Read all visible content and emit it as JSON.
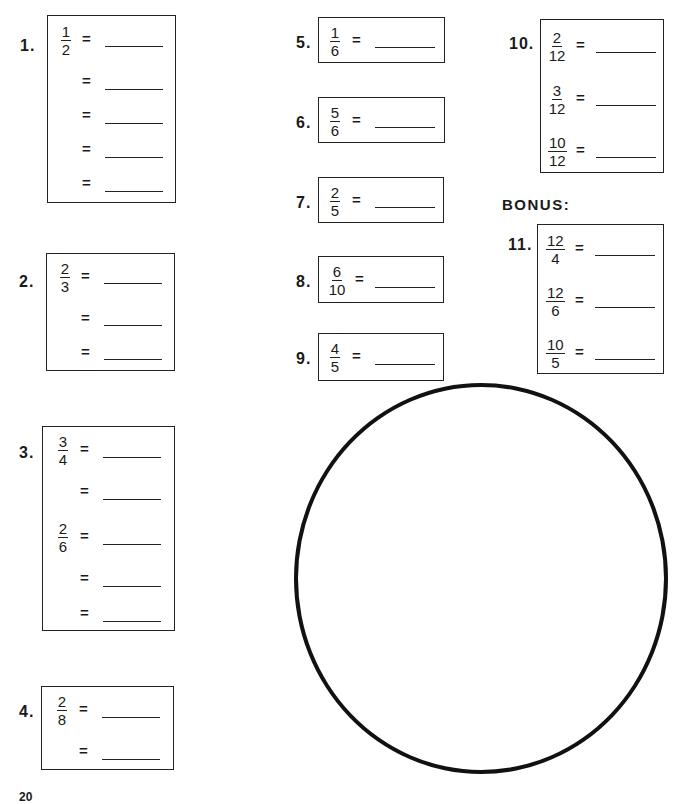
{
  "worksheet": {
    "bonus_label": "BONUS:",
    "equals_sign": "=",
    "page_number": "20",
    "problems": [
      {
        "label": "1.",
        "fractions": [
          {
            "n": "1",
            "d": "2"
          }
        ],
        "blank_count": 5
      },
      {
        "label": "2.",
        "fractions": [
          {
            "n": "2",
            "d": "3"
          }
        ],
        "blank_count": 3
      },
      {
        "label": "3.",
        "fractions": [
          {
            "n": "3",
            "d": "4"
          },
          {
            "n": "2",
            "d": "6"
          }
        ],
        "blank_count": 5
      },
      {
        "label": "4.",
        "fractions": [
          {
            "n": "2",
            "d": "8"
          }
        ],
        "blank_count": 2
      },
      {
        "label": "5.",
        "fractions": [
          {
            "n": "1",
            "d": "6"
          }
        ],
        "blank_count": 1
      },
      {
        "label": "6.",
        "fractions": [
          {
            "n": "5",
            "d": "6"
          }
        ],
        "blank_count": 1
      },
      {
        "label": "7.",
        "fractions": [
          {
            "n": "2",
            "d": "5"
          }
        ],
        "blank_count": 1
      },
      {
        "label": "8.",
        "fractions": [
          {
            "n": "6",
            "d": "10"
          }
        ],
        "blank_count": 1
      },
      {
        "label": "9.",
        "fractions": [
          {
            "n": "4",
            "d": "5"
          }
        ],
        "blank_count": 1
      },
      {
        "label": "10.",
        "fractions": [
          {
            "n": "2",
            "d": "12"
          },
          {
            "n": "3",
            "d": "12"
          },
          {
            "n": "10",
            "d": "12"
          }
        ],
        "blank_count": 3
      },
      {
        "label": "11.",
        "fractions": [
          {
            "n": "12",
            "d": "4"
          },
          {
            "n": "12",
            "d": "6"
          },
          {
            "n": "10",
            "d": "5"
          }
        ],
        "blank_count": 3
      }
    ],
    "circle": {
      "shape": "empty-circle"
    }
  }
}
